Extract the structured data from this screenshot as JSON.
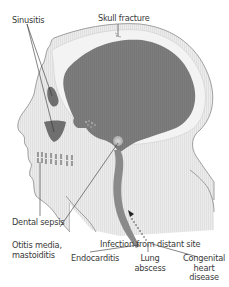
{
  "colors": {
    "tissue": "#e9e9e9",
    "tissue_stripe": "#dcdcdc",
    "skull_band": "#f4f4f4",
    "brain": "#7c7c7c",
    "sinus": "#7a7a7a",
    "outline": "#8a8a8a",
    "leader": "#333333",
    "text": "#3a3a3a"
  },
  "labels": {
    "sinusitis": "Sinusitis",
    "skull_fracture": "Skull fracture",
    "dental_sepsis": "Dental sepsis",
    "otitis_line1": "Otitis media,",
    "otitis_line2": "mastoiditis",
    "infection_distant": "Infection from distant site",
    "endocarditis": "Endocarditis",
    "lung_line1": "Lung",
    "lung_line2": "abscess",
    "congenital_line1": "Congenital",
    "congenital_line2": "heart",
    "congenital_line3": "disease"
  }
}
